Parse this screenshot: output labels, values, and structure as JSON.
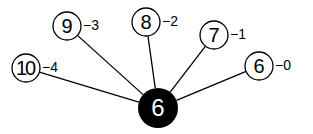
{
  "diagram": {
    "center": {
      "label": "6",
      "x": 158,
      "y": 108,
      "r": 20,
      "fill": "#000000",
      "text_color": "#ffffff"
    },
    "nodes": [
      {
        "label": "10",
        "x": 26,
        "y": 68,
        "weight": "−4"
      },
      {
        "label": "9",
        "x": 67,
        "y": 26,
        "weight": "−3"
      },
      {
        "label": "8",
        "x": 146,
        "y": 22,
        "weight": "−2"
      },
      {
        "label": "7",
        "x": 214,
        "y": 35,
        "weight": "−1"
      },
      {
        "label": "6",
        "x": 259,
        "y": 66,
        "weight": "−0"
      }
    ],
    "node_radius": 14,
    "stroke_color": "#000000"
  }
}
